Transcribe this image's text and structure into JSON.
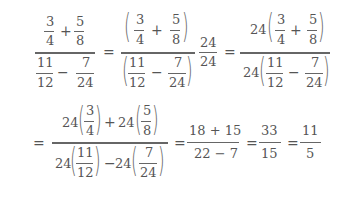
{
  "line1": {
    "frac1": {
      "num": {
        "a_num": "3",
        "a_den": "4",
        "op": "+",
        "b_num": "5",
        "b_den": "8"
      },
      "den": {
        "a_num": "11",
        "a_den": "12",
        "op": "−",
        "b_num": "7",
        "b_den": "24"
      }
    },
    "eq1": "=",
    "frac2": {
      "num": {
        "a_num": "3",
        "a_den": "4",
        "op": "+",
        "b_num": "5",
        "b_den": "8"
      },
      "den": {
        "a_num": "11",
        "a_den": "12",
        "op": "−",
        "b_num": "7",
        "b_den": "24"
      },
      "mult_num": "24",
      "mult_den": "24"
    },
    "eq2": "=",
    "frac3": {
      "num": {
        "coef": "24",
        "a_num": "3",
        "a_den": "4",
        "op": "+",
        "b_num": "5",
        "b_den": "8"
      },
      "den": {
        "coef": "24",
        "a_num": "11",
        "a_den": "12",
        "op": "−",
        "b_num": "7",
        "b_den": "24"
      }
    }
  },
  "line2": {
    "eq0": "=",
    "frac4": {
      "num": {
        "coef_a": "24",
        "a_num": "3",
        "a_den": "4",
        "op": "+",
        "coef_b": "24",
        "b_num": "5",
        "b_den": "8"
      },
      "den": {
        "coef_a": "24",
        "a_num": "11",
        "a_den": "12",
        "op": "−",
        "coef_b": "24",
        "b_num": "7",
        "b_den": "24"
      }
    },
    "eq1": "=",
    "frac5": {
      "num": "18 + 15",
      "den": "22 − 7"
    },
    "eq2": "=",
    "frac6": {
      "num": "33",
      "den": "15"
    },
    "eq3": "=",
    "frac7": {
      "num": "11",
      "den": "5"
    }
  }
}
